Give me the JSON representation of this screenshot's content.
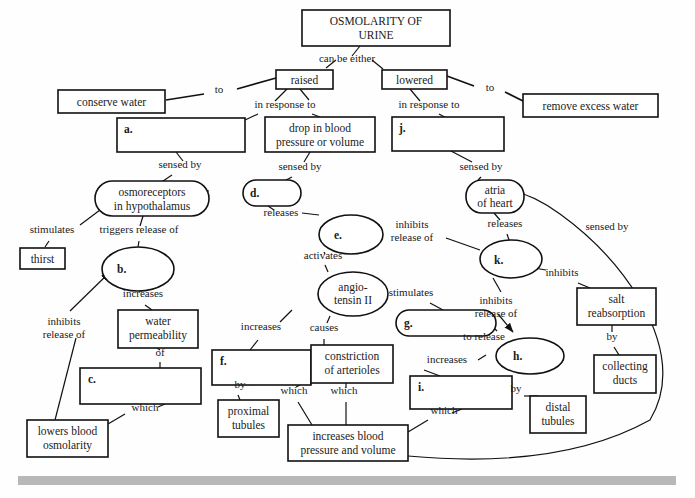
{
  "colors": {
    "stroke": "#111111",
    "fill": "#ffffff",
    "text": "#1a1a1a",
    "footer_bar": "#b8b8b8"
  },
  "nodes": [
    {
      "id": "root",
      "label": "OSMOLARITY OF\nURINE",
      "shape": "rect",
      "x": 302,
      "y": 10,
      "w": 148,
      "h": 36
    },
    {
      "id": "raised",
      "label": "raised",
      "shape": "rect",
      "x": 276,
      "y": 70,
      "w": 57,
      "h": 19
    },
    {
      "id": "lowered",
      "label": "lowered",
      "shape": "rect",
      "x": 382,
      "y": 70,
      "w": 65,
      "h": 19
    },
    {
      "id": "conserve",
      "label": "conserve water",
      "shape": "rect",
      "x": 58,
      "y": 90,
      "w": 107,
      "h": 23
    },
    {
      "id": "removewater",
      "label": "remove excess water",
      "shape": "rect",
      "x": 523,
      "y": 94,
      "w": 135,
      "h": 23
    },
    {
      "id": "a",
      "label": "a.",
      "shape": "rect",
      "x": 117,
      "y": 118,
      "w": 128,
      "h": 34,
      "blank": true
    },
    {
      "id": "drop",
      "label": "drop in blood\npressure or volume",
      "shape": "rect",
      "x": 265,
      "y": 117,
      "w": 110,
      "h": 35
    },
    {
      "id": "j",
      "label": "j.",
      "shape": "rect",
      "x": 392,
      "y": 117,
      "w": 112,
      "h": 34,
      "blank": true
    },
    {
      "id": "osmo",
      "label": "osmoreceptors\nin hypothalamus",
      "shape": "stadium",
      "x": 95,
      "y": 181,
      "w": 114,
      "h": 35
    },
    {
      "id": "d",
      "label": "d.",
      "shape": "stadium",
      "x": 243,
      "y": 180,
      "w": 58,
      "h": 26,
      "blank": true
    },
    {
      "id": "atria",
      "label": "atria\nof heart",
      "shape": "stadium",
      "x": 466,
      "y": 180,
      "w": 58,
      "h": 33
    },
    {
      "id": "thirst",
      "label": "thirst",
      "shape": "rect",
      "x": 20,
      "y": 248,
      "w": 45,
      "h": 21
    },
    {
      "id": "b",
      "label": "b.",
      "shape": "ellipse",
      "x": 102,
      "y": 247,
      "w": 72,
      "h": 44,
      "blank": true
    },
    {
      "id": "e",
      "label": "e.",
      "shape": "ellipse",
      "x": 319,
      "y": 215,
      "w": 64,
      "h": 39,
      "blank": true
    },
    {
      "id": "k",
      "label": "k.",
      "shape": "ellipse",
      "x": 480,
      "y": 240,
      "w": 62,
      "h": 38,
      "blank": true
    },
    {
      "id": "salt",
      "label": "salt\nreabsorption",
      "shape": "rect",
      "x": 577,
      "y": 288,
      "w": 79,
      "h": 37
    },
    {
      "id": "angio",
      "label": "angio-\ntensin II",
      "shape": "ellipse",
      "x": 318,
      "y": 272,
      "w": 70,
      "h": 44
    },
    {
      "id": "g",
      "label": "g.",
      "shape": "stadium",
      "x": 396,
      "y": 310,
      "w": 100,
      "h": 26,
      "blank": true
    },
    {
      "id": "water",
      "label": "water\npermeability",
      "shape": "rect",
      "x": 118,
      "y": 310,
      "w": 80,
      "h": 38
    },
    {
      "id": "c",
      "label": "c.",
      "shape": "rect",
      "x": 80,
      "y": 368,
      "w": 121,
      "h": 36,
      "blank": true
    },
    {
      "id": "f",
      "label": "f.",
      "shape": "rect",
      "x": 212,
      "y": 350,
      "w": 99,
      "h": 35,
      "blank": true
    },
    {
      "id": "constrict",
      "label": "constriction\nof arterioles",
      "shape": "rect",
      "x": 322,
      "y": 345,
      "w": 74,
      "h": 38
    },
    {
      "id": "h",
      "label": "h.",
      "shape": "ellipse",
      "x": 520,
      "y": 338,
      "w": 68,
      "h": 36,
      "blank": true
    },
    {
      "id": "i",
      "label": "i.",
      "shape": "rect",
      "x": 410,
      "y": 376,
      "w": 102,
      "h": 33,
      "blank": true
    },
    {
      "id": "collecting",
      "label": "collecting\nducts",
      "shape": "rect",
      "x": 594,
      "y": 355,
      "w": 62,
      "h": 38
    },
    {
      "id": "proximal",
      "label": "proximal\ntubules",
      "shape": "rect",
      "x": 218,
      "y": 400,
      "w": 61,
      "h": 37
    },
    {
      "id": "distal",
      "label": "distal\ntubules",
      "shape": "rect",
      "x": 530,
      "y": 396,
      "w": 56,
      "h": 37
    },
    {
      "id": "lowersblood",
      "label": "lowers blood\nosmolarity",
      "shape": "rect",
      "x": 27,
      "y": 420,
      "w": 81,
      "h": 37
    },
    {
      "id": "increasesbp",
      "label": "increases blood\npressure and volume",
      "shape": "rect",
      "x": 288,
      "y": 425,
      "w": 120,
      "h": 36
    }
  ],
  "links": [
    {
      "label": "can be either",
      "x": 347,
      "y": 62
    },
    {
      "label": "to",
      "x": 219,
      "y": 93
    },
    {
      "label": "to",
      "x": 490,
      "y": 91
    },
    {
      "label": "in response to",
      "x": 285,
      "y": 108
    },
    {
      "label": "in response to",
      "x": 429,
      "y": 108
    },
    {
      "label": "sensed by",
      "x": 180,
      "y": 168
    },
    {
      "label": "sensed by",
      "x": 300,
      "y": 170
    },
    {
      "label": "sensed by",
      "x": 481,
      "y": 170
    },
    {
      "label": "stimulates",
      "x": 52,
      "y": 233
    },
    {
      "label": "triggers release of",
      "x": 139,
      "y": 233
    },
    {
      "label": "releases",
      "x": 281,
      "y": 216
    },
    {
      "label": "releases",
      "x": 505,
      "y": 227
    },
    {
      "label": "inhibits\nrelease of",
      "x": 412,
      "y": 228
    },
    {
      "label": "activates",
      "x": 323,
      "y": 259
    },
    {
      "label": "increases",
      "x": 143,
      "y": 297
    },
    {
      "label": "inhibits",
      "x": 562,
      "y": 276
    },
    {
      "label": "sensed by",
      "x": 607,
      "y": 230
    },
    {
      "label": "inhibits\nrelease of",
      "x": 496,
      "y": 304
    },
    {
      "label": "stimulates",
      "x": 411,
      "y": 296
    },
    {
      "label": "increases",
      "x": 261,
      "y": 330
    },
    {
      "label": "causes",
      "x": 324,
      "y": 331
    },
    {
      "label": "of",
      "x": 160,
      "y": 356
    },
    {
      "label": "to release",
      "x": 484,
      "y": 340
    },
    {
      "label": "increases",
      "x": 447,
      "y": 363
    },
    {
      "label": "by",
      "x": 612,
      "y": 340
    },
    {
      "label": "inhibits\nrelease of",
      "x": 64,
      "y": 325
    },
    {
      "label": "by",
      "x": 240,
      "y": 388
    },
    {
      "label": "which",
      "x": 294,
      "y": 394
    },
    {
      "label": "which",
      "x": 344,
      "y": 394
    },
    {
      "label": "by",
      "x": 516,
      "y": 392
    },
    {
      "label": "which",
      "x": 145,
      "y": 411
    },
    {
      "label": "which",
      "x": 444,
      "y": 414
    }
  ]
}
